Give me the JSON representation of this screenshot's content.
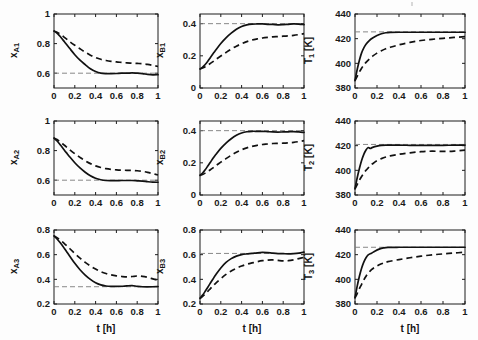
{
  "figure": {
    "type": "multi-panel-line-figure",
    "rows": 3,
    "cols": 3,
    "width": 478,
    "height": 340,
    "background": "#ffffff",
    "line_color": "#111111",
    "reference_color": "#7a7a7a"
  },
  "legend": {
    "solid_label": "solid",
    "dashed_label": "dashed"
  },
  "axis": {
    "xlabel": "t [h]",
    "x_unit": "h",
    "xticks": [
      0,
      0.2,
      0.4,
      0.6,
      0.8,
      1
    ],
    "xticklabels": [
      "0",
      "0.2",
      "0.4",
      "0.6",
      "0.8",
      "1"
    ],
    "xlim": [
      0,
      1
    ]
  },
  "chart_data": [
    {
      "id": "xA1",
      "type": "line",
      "row": 0,
      "col": 0,
      "title": "",
      "xlabel": "",
      "ylabel": "x_A1",
      "ylabel_base": "x",
      "ylabel_sub": "A1",
      "xlim": [
        0,
        1
      ],
      "ylim": [
        0.5,
        1.0
      ],
      "yticks": [
        0.6,
        0.8,
        1
      ],
      "yticklabels": [
        "0.6",
        "0.8",
        "1"
      ],
      "grid": false,
      "reference_line": 0.6,
      "x": [
        0,
        0.025,
        0.05,
        0.075,
        0.1,
        0.125,
        0.15,
        0.2,
        0.25,
        0.3,
        0.35,
        0.4,
        0.45,
        0.5,
        0.55,
        0.6,
        0.65,
        0.7,
        0.75,
        0.8,
        0.85,
        0.9,
        0.95,
        1
      ],
      "series": [
        {
          "name": "solid",
          "style": "solid",
          "values": [
            0.885,
            0.872,
            0.855,
            0.835,
            0.812,
            0.79,
            0.768,
            0.725,
            0.688,
            0.658,
            0.63,
            0.611,
            0.6,
            0.597,
            0.597,
            0.598,
            0.6,
            0.6,
            0.602,
            0.6,
            0.597,
            0.592,
            0.589,
            0.59
          ]
        },
        {
          "name": "dashed",
          "style": "dashed",
          "values": [
            0.885,
            0.878,
            0.868,
            0.856,
            0.842,
            0.828,
            0.814,
            0.789,
            0.765,
            0.742,
            0.722,
            0.706,
            0.694,
            0.686,
            0.68,
            0.676,
            0.673,
            0.67,
            0.668,
            0.666,
            0.664,
            0.66,
            0.653,
            0.645
          ]
        }
      ]
    },
    {
      "id": "xB1",
      "type": "line",
      "row": 0,
      "col": 1,
      "title": "",
      "xlabel": "",
      "ylabel": "x_B1",
      "ylabel_base": "x",
      "ylabel_sub": "B1",
      "xlim": [
        0,
        1
      ],
      "ylim": [
        0,
        0.46
      ],
      "yticks": [
        0,
        0.2,
        0.4
      ],
      "yticklabels": [
        "0",
        "0.2",
        "0.4"
      ],
      "grid": false,
      "reference_line": 0.4,
      "x": [
        0,
        0.025,
        0.05,
        0.075,
        0.1,
        0.125,
        0.15,
        0.2,
        0.25,
        0.3,
        0.35,
        0.4,
        0.45,
        0.5,
        0.55,
        0.6,
        0.65,
        0.7,
        0.75,
        0.8,
        0.85,
        0.9,
        0.95,
        1
      ],
      "series": [
        {
          "name": "solid",
          "style": "solid",
          "values": [
            0.118,
            0.13,
            0.146,
            0.166,
            0.19,
            0.213,
            0.235,
            0.277,
            0.312,
            0.341,
            0.365,
            0.382,
            0.392,
            0.397,
            0.398,
            0.398,
            0.396,
            0.395,
            0.393,
            0.394,
            0.396,
            0.398,
            0.397,
            0.394
          ]
        },
        {
          "name": "dashed",
          "style": "dashed",
          "values": [
            0.118,
            0.124,
            0.132,
            0.142,
            0.153,
            0.164,
            0.176,
            0.199,
            0.221,
            0.242,
            0.26,
            0.275,
            0.288,
            0.298,
            0.305,
            0.311,
            0.315,
            0.318,
            0.32,
            0.322,
            0.324,
            0.327,
            0.332,
            0.338
          ]
        }
      ]
    },
    {
      "id": "T1",
      "type": "line",
      "row": 0,
      "col": 2,
      "title": "",
      "xlabel": "",
      "ylabel": "T_1 [K]",
      "ylabel_base": "T",
      "ylabel_sub": "1",
      "ylabel_unit": " [K]",
      "xlim": [
        0,
        1
      ],
      "ylim": [
        380,
        440
      ],
      "yticks": [
        380,
        400,
        420,
        440
      ],
      "yticklabels": [
        "380",
        "400",
        "420",
        "440"
      ],
      "grid": false,
      "reference_line": 425.5,
      "x": [
        0,
        0.02,
        0.04,
        0.06,
        0.08,
        0.1,
        0.13,
        0.16,
        0.2,
        0.24,
        0.28,
        0.32,
        0.4,
        0.5,
        0.6,
        0.7,
        0.8,
        0.9,
        1
      ],
      "series": [
        {
          "name": "solid",
          "style": "solid",
          "values": [
            386,
            395,
            402.5,
            408.5,
            412.5,
            415.5,
            418.5,
            420.5,
            422.5,
            424,
            424.8,
            425.1,
            425.2,
            425.2,
            425.2,
            425.2,
            425.2,
            425.2,
            425.2
          ]
        },
        {
          "name": "dashed",
          "style": "dashed",
          "values": [
            386,
            389.5,
            393,
            396,
            398.5,
            400.8,
            403.5,
            405.8,
            408.3,
            410.2,
            411.8,
            413,
            415,
            417,
            418.5,
            419.5,
            420.3,
            421,
            421.6
          ]
        }
      ]
    },
    {
      "id": "xA2",
      "type": "line",
      "row": 1,
      "col": 0,
      "title": "",
      "xlabel": "",
      "ylabel": "x_A2",
      "ylabel_base": "x",
      "ylabel_sub": "A2",
      "xlim": [
        0,
        1
      ],
      "ylim": [
        0.5,
        1.0
      ],
      "yticks": [
        0.6,
        0.8,
        1
      ],
      "yticklabels": [
        "0.6",
        "0.8",
        "1"
      ],
      "grid": false,
      "reference_line": 0.6,
      "x": [
        0,
        0.025,
        0.05,
        0.075,
        0.1,
        0.125,
        0.15,
        0.2,
        0.25,
        0.3,
        0.35,
        0.4,
        0.45,
        0.5,
        0.55,
        0.6,
        0.65,
        0.7,
        0.75,
        0.8,
        0.85,
        0.9,
        0.95,
        1
      ],
      "series": [
        {
          "name": "solid",
          "style": "solid",
          "values": [
            0.885,
            0.868,
            0.848,
            0.826,
            0.803,
            0.781,
            0.759,
            0.718,
            0.683,
            0.654,
            0.63,
            0.613,
            0.603,
            0.598,
            0.597,
            0.597,
            0.598,
            0.598,
            0.598,
            0.596,
            0.594,
            0.59,
            0.587,
            0.586
          ]
        },
        {
          "name": "dashed",
          "style": "dashed",
          "values": [
            0.885,
            0.876,
            0.864,
            0.85,
            0.836,
            0.821,
            0.806,
            0.779,
            0.754,
            0.731,
            0.712,
            0.697,
            0.686,
            0.678,
            0.673,
            0.67,
            0.668,
            0.667,
            0.666,
            0.664,
            0.66,
            0.653,
            0.644,
            0.635
          ]
        }
      ]
    },
    {
      "id": "xB2",
      "type": "line",
      "row": 1,
      "col": 1,
      "title": "",
      "xlabel": "",
      "ylabel": "x_B2",
      "ylabel_base": "x",
      "ylabel_sub": "B2",
      "xlim": [
        0,
        1
      ],
      "ylim": [
        0,
        0.46
      ],
      "yticks": [
        0,
        0.2,
        0.4
      ],
      "yticklabels": [
        "0",
        "0.2",
        "0.4"
      ],
      "grid": false,
      "reference_line": 0.4,
      "x": [
        0,
        0.025,
        0.05,
        0.075,
        0.1,
        0.125,
        0.15,
        0.2,
        0.25,
        0.3,
        0.35,
        0.4,
        0.45,
        0.5,
        0.55,
        0.6,
        0.65,
        0.7,
        0.75,
        0.8,
        0.85,
        0.9,
        0.95,
        1
      ],
      "series": [
        {
          "name": "solid",
          "style": "solid",
          "values": [
            0.122,
            0.137,
            0.157,
            0.18,
            0.204,
            0.228,
            0.25,
            0.29,
            0.323,
            0.35,
            0.371,
            0.385,
            0.393,
            0.396,
            0.396,
            0.396,
            0.394,
            0.392,
            0.391,
            0.392,
            0.393,
            0.394,
            0.392,
            0.389
          ]
        },
        {
          "name": "dashed",
          "style": "dashed",
          "values": [
            0.122,
            0.128,
            0.136,
            0.146,
            0.157,
            0.169,
            0.181,
            0.204,
            0.226,
            0.247,
            0.265,
            0.281,
            0.293,
            0.302,
            0.309,
            0.314,
            0.317,
            0.32,
            0.321,
            0.322,
            0.324,
            0.327,
            0.332,
            0.338
          ]
        }
      ]
    },
    {
      "id": "T2",
      "type": "line",
      "row": 1,
      "col": 2,
      "title": "",
      "xlabel": "",
      "ylabel": "T_2 [K]",
      "ylabel_base": "T",
      "ylabel_sub": "2",
      "ylabel_unit": " [K]",
      "xlim": [
        0,
        1
      ],
      "ylim": [
        380,
        440
      ],
      "yticks": [
        380,
        400,
        420,
        440
      ],
      "yticklabels": [
        "380",
        "400",
        "420",
        "440"
      ],
      "grid": false,
      "reference_line": 421,
      "x": [
        0,
        0.02,
        0.04,
        0.06,
        0.08,
        0.1,
        0.12,
        0.14,
        0.16,
        0.2,
        0.24,
        0.28,
        0.32,
        0.4,
        0.5,
        0.6,
        0.7,
        0.8,
        0.9,
        1
      ],
      "series": [
        {
          "name": "solid",
          "style": "solid",
          "values": [
            385,
            394,
            401.5,
            408,
            413,
            416.5,
            418.5,
            417.8,
            418.6,
            419.6,
            420.2,
            420.4,
            420.4,
            420.4,
            420.3,
            420.2,
            420.2,
            420.3,
            420.4,
            420.5
          ]
        },
        {
          "name": "dashed",
          "style": "dashed",
          "values": [
            385,
            388.5,
            392,
            395,
            397.5,
            400,
            402,
            403.8,
            405.3,
            407.8,
            409.5,
            410.8,
            411.7,
            413,
            414.2,
            415.1,
            415.5,
            415.3,
            415.6,
            416.4
          ]
        }
      ]
    },
    {
      "id": "xA3",
      "type": "line",
      "row": 2,
      "col": 0,
      "title": "",
      "xlabel": "t [h]",
      "ylabel": "x_A3",
      "ylabel_base": "x",
      "ylabel_sub": "A3",
      "xlim": [
        0,
        1
      ],
      "ylim": [
        0.2,
        0.8
      ],
      "yticks": [
        0.2,
        0.4,
        0.6,
        0.8
      ],
      "yticklabels": [
        "0.2",
        "0.4",
        "0.6",
        "0.8"
      ],
      "grid": false,
      "reference_line": 0.34,
      "x": [
        0,
        0.025,
        0.05,
        0.075,
        0.1,
        0.125,
        0.15,
        0.2,
        0.25,
        0.3,
        0.35,
        0.4,
        0.45,
        0.5,
        0.55,
        0.6,
        0.65,
        0.7,
        0.75,
        0.8,
        0.85,
        0.9,
        0.95,
        1
      ],
      "series": [
        {
          "name": "solid",
          "style": "solid",
          "values": [
            0.752,
            0.731,
            0.707,
            0.68,
            0.65,
            0.62,
            0.59,
            0.53,
            0.478,
            0.435,
            0.4,
            0.372,
            0.355,
            0.346,
            0.343,
            0.343,
            0.344,
            0.347,
            0.349,
            0.344,
            0.34,
            0.339,
            0.34,
            0.342
          ]
        },
        {
          "name": "dashed",
          "style": "dashed",
          "values": [
            0.752,
            0.74,
            0.725,
            0.708,
            0.69,
            0.67,
            0.65,
            0.61,
            0.572,
            0.538,
            0.508,
            0.483,
            0.462,
            0.447,
            0.436,
            0.428,
            0.423,
            0.42,
            0.423,
            0.427,
            0.424,
            0.416,
            0.404,
            0.392
          ]
        }
      ]
    },
    {
      "id": "xB3",
      "type": "line",
      "row": 2,
      "col": 1,
      "title": "",
      "xlabel": "t [h]",
      "ylabel": "x_B3",
      "ylabel_base": "x",
      "ylabel_sub": "B3",
      "xlim": [
        0,
        1
      ],
      "ylim": [
        0.2,
        0.8
      ],
      "yticks": [
        0.2,
        0.4,
        0.6,
        0.8
      ],
      "yticklabels": [
        "0.2",
        "0.4",
        "0.6",
        "0.8"
      ],
      "grid": false,
      "reference_line": 0.61,
      "x": [
        0,
        0.025,
        0.05,
        0.075,
        0.1,
        0.125,
        0.15,
        0.2,
        0.25,
        0.3,
        0.35,
        0.4,
        0.45,
        0.5,
        0.55,
        0.6,
        0.65,
        0.7,
        0.75,
        0.8,
        0.85,
        0.9,
        0.95,
        1
      ],
      "series": [
        {
          "name": "solid",
          "style": "solid",
          "values": [
            0.245,
            0.272,
            0.303,
            0.336,
            0.37,
            0.403,
            0.435,
            0.492,
            0.537,
            0.568,
            0.588,
            0.6,
            0.606,
            0.61,
            0.615,
            0.618,
            0.616,
            0.612,
            0.609,
            0.608,
            0.607,
            0.609,
            0.613,
            0.62
          ]
        },
        {
          "name": "dashed",
          "style": "dashed",
          "values": [
            0.245,
            0.262,
            0.282,
            0.303,
            0.325,
            0.347,
            0.368,
            0.406,
            0.44,
            0.468,
            0.49,
            0.508,
            0.522,
            0.533,
            0.543,
            0.551,
            0.556,
            0.557,
            0.553,
            0.549,
            0.551,
            0.558,
            0.568,
            0.578
          ]
        }
      ]
    },
    {
      "id": "T3",
      "type": "line",
      "row": 2,
      "col": 2,
      "title": "",
      "xlabel": "t [h]",
      "ylabel": "T_3 [K]",
      "ylabel_base": "T",
      "ylabel_sub": "3",
      "ylabel_unit": " [K]",
      "xlim": [
        0,
        1
      ],
      "ylim": [
        380,
        440
      ],
      "yticks": [
        380,
        400,
        420,
        440
      ],
      "yticklabels": [
        "380",
        "400",
        "420",
        "440"
      ],
      "grid": false,
      "reference_line": 426,
      "x": [
        0,
        0.02,
        0.04,
        0.06,
        0.08,
        0.1,
        0.12,
        0.15,
        0.18,
        0.22,
        0.26,
        0.3,
        0.4,
        0.5,
        0.6,
        0.7,
        0.8,
        0.9,
        1
      ],
      "series": [
        {
          "name": "solid",
          "style": "solid",
          "values": [
            385,
            394.5,
            402.5,
            409,
            414,
            417.5,
            419.8,
            421.2,
            422.8,
            424.5,
            425.5,
            425.9,
            426,
            426,
            426,
            426,
            426,
            426,
            426
          ]
        },
        {
          "name": "dashed",
          "style": "dashed",
          "values": [
            385,
            388.5,
            392.5,
            396,
            399.5,
            402.5,
            405,
            407.8,
            409.8,
            411.8,
            413.2,
            414.3,
            416,
            417.5,
            418.8,
            419.8,
            420.6,
            421.3,
            422
          ]
        }
      ]
    }
  ]
}
